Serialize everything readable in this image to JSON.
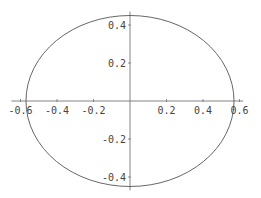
{
  "chart_data": {
    "type": "line",
    "title": "",
    "xlabel": "",
    "ylabel": "",
    "series": [
      {
        "name": "ellipse",
        "shape": "ellipse",
        "center": [
          0,
          0
        ],
        "semi_axis_x": 0.57,
        "semi_axis_y": 0.45
      }
    ],
    "xlim": [
      -0.65,
      0.62
    ],
    "ylim": [
      -0.47,
      0.47
    ],
    "x_ticks": [
      -0.6,
      -0.4,
      -0.2,
      0.2,
      0.4,
      0.6
    ],
    "x_tick_labels": [
      "-0.6",
      "-0.4",
      "-0.2",
      "0.2",
      "0.4",
      "0.6"
    ],
    "y_ticks": [
      -0.4,
      -0.2,
      0.2,
      0.4
    ],
    "y_tick_labels": [
      "-0.4",
      "-0.2",
      "0.2",
      "0.4"
    ],
    "grid": false,
    "legend": null,
    "axes_style": "axes through origin"
  },
  "colors": {
    "line": "#555555",
    "axis": "#666666",
    "text": "#444444",
    "background": "#ffffff"
  }
}
